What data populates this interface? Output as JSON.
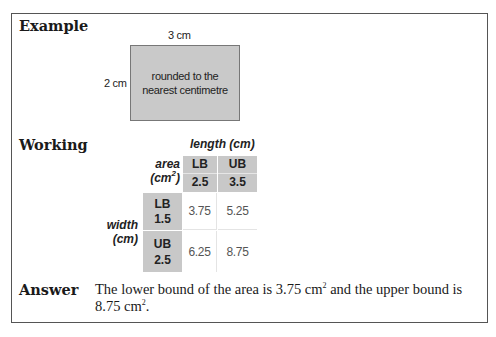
{
  "sections": {
    "example": {
      "label": "Example",
      "diagram": {
        "width_label": "3 cm",
        "height_label": "2 cm",
        "note_line1": "rounded to the",
        "note_line2": "nearest centimetre",
        "fill_color": "#c9c9c9"
      }
    },
    "working": {
      "label": "Working",
      "table": {
        "title": "length (cm)",
        "corner_line1": "area",
        "corner_line2_base": "(cm",
        "corner_line2_sup": "2",
        "corner_line2_end": ")",
        "row_axis_line1": "width",
        "row_axis_line2": "(cm)",
        "columns": [
          {
            "bound": "LB",
            "value": "2.5"
          },
          {
            "bound": "UB",
            "value": "3.5"
          }
        ],
        "rows": [
          {
            "bound": "LB",
            "value": "1.5",
            "cells": [
              "3.75",
              "5.25"
            ]
          },
          {
            "bound": "UB",
            "value": "2.5",
            "cells": [
              "6.25",
              "8.75"
            ]
          }
        ],
        "header_color": "#c8c8c8"
      }
    },
    "answer": {
      "label": "Answer",
      "text_part1": "The lower bound of the area is 3.75 cm",
      "sup1": "2",
      "text_part2": " and the upper bound is 8.75 cm",
      "sup2": "2",
      "text_part3": "."
    }
  }
}
